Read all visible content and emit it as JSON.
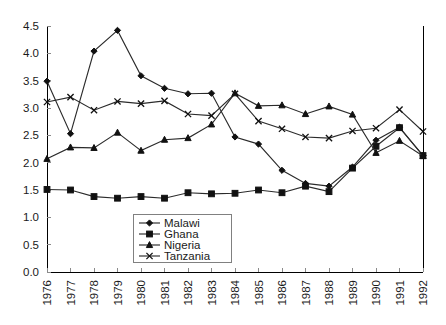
{
  "chart_data": {
    "type": "line",
    "title": "",
    "subtitle": "",
    "xlabel": "",
    "ylabel": "",
    "xlim": [
      1976,
      1992
    ],
    "ylim": [
      0.0,
      4.5
    ],
    "grid": false,
    "legend_position": "inside-bottom-center",
    "x": [
      1976,
      1977,
      1978,
      1979,
      1980,
      1981,
      1982,
      1983,
      1984,
      1985,
      1986,
      1987,
      1988,
      1989,
      1990,
      1991,
      1992
    ],
    "categories": [
      "1976",
      "1977",
      "1978",
      "1979",
      "1980",
      "1981",
      "1982",
      "1983",
      "1984",
      "1985",
      "1986",
      "1987",
      "1988",
      "1989",
      "1990",
      "1991",
      "1992"
    ],
    "ytick_labels": [
      "0.0",
      "0.5",
      "1.0",
      "1.5",
      "2.0",
      "2.5",
      "3.0",
      "3.5",
      "4.0",
      "4.5"
    ],
    "ytick_values": [
      0.0,
      0.5,
      1.0,
      1.5,
      2.0,
      2.5,
      3.0,
      3.5,
      4.0,
      4.5
    ],
    "series": [
      {
        "name": "Malawi",
        "marker": "diamond",
        "values": [
          3.49,
          2.53,
          4.04,
          4.42,
          3.59,
          3.36,
          3.26,
          3.27,
          2.47,
          2.34,
          1.86,
          1.62,
          1.57,
          1.92,
          2.41,
          2.65,
          2.13
        ]
      },
      {
        "name": "Ghana",
        "marker": "square",
        "values": [
          1.51,
          1.5,
          1.38,
          1.35,
          1.38,
          1.35,
          1.45,
          1.43,
          1.44,
          1.5,
          1.45,
          1.57,
          1.47,
          1.9,
          2.3,
          2.64,
          2.13
        ]
      },
      {
        "name": "Nigeria",
        "marker": "triangle",
        "values": [
          2.07,
          2.28,
          2.27,
          2.55,
          2.22,
          2.42,
          2.45,
          2.7,
          3.27,
          3.04,
          3.05,
          2.89,
          3.03,
          2.88,
          2.18,
          2.4,
          2.12
        ]
      },
      {
        "name": "Tanzania",
        "marker": "x",
        "values": [
          3.11,
          3.2,
          2.96,
          3.12,
          3.08,
          3.13,
          2.89,
          2.86,
          3.26,
          2.76,
          2.62,
          2.47,
          2.45,
          2.58,
          2.63,
          2.97,
          2.57
        ]
      }
    ]
  },
  "legend": {
    "entries": [
      {
        "label": "Malawi"
      },
      {
        "label": "Ghana"
      },
      {
        "label": "Nigeria"
      },
      {
        "label": "Tanzania"
      }
    ]
  },
  "colors": {
    "line": "#2b2b2b",
    "marker": "#111111",
    "axis": "#000000",
    "tick": "#8a8a8a",
    "legend_border": "#808080",
    "background": "#ffffff",
    "text": "#1a1a1a"
  }
}
